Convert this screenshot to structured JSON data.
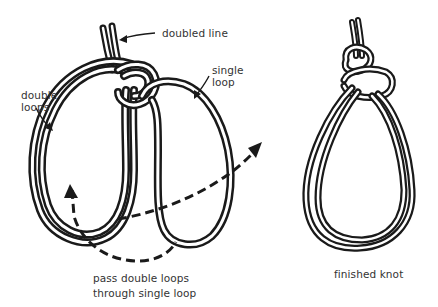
{
  "diagram": {
    "type": "knot-tying-instruction",
    "colors": {
      "rope": "#1a1a1a",
      "text": "#333333",
      "background": "#ffffff"
    },
    "step_1": {
      "labels": {
        "doubled_line": "doubled line",
        "single_loop_1": "single",
        "single_loop_2": "loop",
        "double_loops_1": "double",
        "double_loops_2": "loops"
      },
      "caption_line_1": "pass double loops",
      "caption_line_2": "through  single loop"
    },
    "step_2": {
      "caption": "finished knot"
    }
  }
}
